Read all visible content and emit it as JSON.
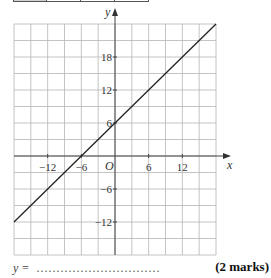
{
  "chart_data": {
    "type": "line",
    "title": "",
    "xlabel": "x",
    "ylabel": "y",
    "xlim": [
      -18,
      18
    ],
    "ylim": [
      -18,
      24
    ],
    "grid": true,
    "grid_step": 3,
    "x_ticks": [
      -12,
      -6,
      6,
      12
    ],
    "y_ticks": [
      18,
      12,
      6,
      -6,
      -12
    ],
    "x_tick_labels": [
      "−12",
      "−6",
      "6",
      "12"
    ],
    "y_tick_labels": [
      "18",
      "12",
      "6",
      "−6",
      "−12"
    ],
    "origin_label": "O",
    "series": [
      {
        "name": "line",
        "x": [
          -18,
          18
        ],
        "y": [
          -12,
          24
        ],
        "equation_hidden": "y = x + 6"
      }
    ]
  },
  "answer": {
    "prompt": "y =",
    "dots": "...............................",
    "marks": "(2 marks)"
  }
}
